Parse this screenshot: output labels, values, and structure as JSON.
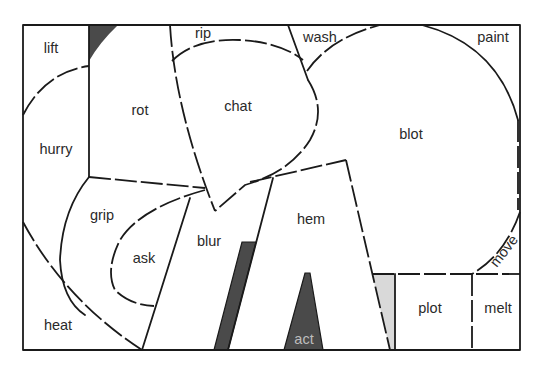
{
  "diagram": {
    "colors": {
      "background": "#ffffff",
      "stroke": "#1a1a1a",
      "dark_fill": "#4a4a4a",
      "light_fill": "#d9d9d9",
      "label": "#2a2a2a"
    },
    "regions": [
      {
        "id": "lift",
        "label": "lift"
      },
      {
        "id": "rot",
        "label": "rot"
      },
      {
        "id": "rip",
        "label": "rip"
      },
      {
        "id": "chat",
        "label": "chat"
      },
      {
        "id": "wash",
        "label": "wash"
      },
      {
        "id": "paint",
        "label": "paint"
      },
      {
        "id": "hurry",
        "label": "hurry"
      },
      {
        "id": "blot",
        "label": "blot"
      },
      {
        "id": "grip",
        "label": "grip"
      },
      {
        "id": "ask",
        "label": "ask"
      },
      {
        "id": "blur",
        "label": "blur"
      },
      {
        "id": "hem",
        "label": "hem"
      },
      {
        "id": "move",
        "label": "move"
      },
      {
        "id": "heat",
        "label": "heat"
      },
      {
        "id": "act",
        "label": "act"
      },
      {
        "id": "plot",
        "label": "plot"
      },
      {
        "id": "melt",
        "label": "melt"
      }
    ]
  }
}
